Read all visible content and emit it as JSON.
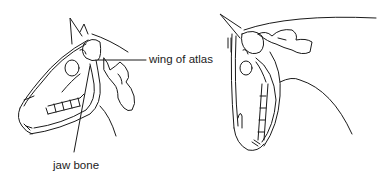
{
  "figure": {
    "panels": [
      {
        "id": "left",
        "description": "horse head in profile, relaxed carriage",
        "labels": [
          {
            "text": "wing of atlas",
            "x": 149,
            "y": 56
          },
          {
            "text": "jaw bone",
            "x": 53,
            "y": 163
          }
        ]
      },
      {
        "id": "right",
        "description": "horse head flexed, chin tucked toward chest",
        "labels": []
      }
    ],
    "colors": {
      "line": "#1a1a1a",
      "background": "#ffffff",
      "text": "#222222"
    }
  }
}
